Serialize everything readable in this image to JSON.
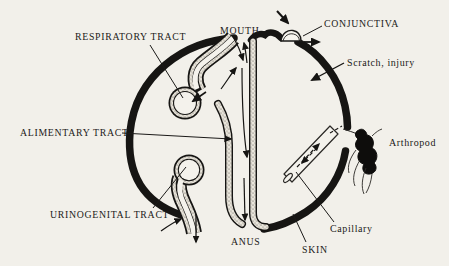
{
  "figure": {
    "title_implicit": "Body surfaces as sites of pathogen entry and exit",
    "colors": {
      "paper": "#f2f0ea",
      "ink": "#161513",
      "stipple_base": "#e9e5db",
      "stipple_dot": "#57534b"
    },
    "labels": {
      "respiratory_tract": "RESPIRATORY TRACT",
      "alimentary_tract": "ALIMENTARY TRACT",
      "urinogenital_tract": "URINOGENITAL TRACT",
      "mouth": "MOUTH",
      "conjunctiva": "CONJUNCTIVA",
      "scratch_injury": "Scratch, injury",
      "arthropod": "Arthropod",
      "capillary": "Capillary",
      "anus": "ANUS",
      "skin": "SKIN"
    }
  }
}
